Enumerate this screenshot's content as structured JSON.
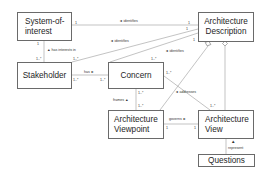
{
  "diagram": {
    "type": "uml-class-diagram",
    "classes": [
      {
        "id": "system_of_interest",
        "label": "System-of-interest"
      },
      {
        "id": "architecture_description",
        "label": "Architecture Description"
      },
      {
        "id": "stakeholder",
        "label": "Stakeholder"
      },
      {
        "id": "concern",
        "label": "Concern"
      },
      {
        "id": "architecture_viewpoint",
        "label": "Architecture Viewpoint"
      },
      {
        "id": "architecture_view",
        "label": "Architecture View"
      },
      {
        "id": "questions",
        "label": "Questions"
      }
    ],
    "labels": {
      "sys_line1": "System-of-",
      "sys_line2": "interest",
      "ad_line1": "Architecture",
      "ad_line2": "Description",
      "stakeholder": "Stakeholder",
      "concern": "Concern",
      "avp_line1": "Architecture",
      "avp_line2": "Viewpoint",
      "av_line1": "Architecture",
      "av_line2": "View",
      "questions": "Questions"
    },
    "associations": [
      {
        "from": "architecture_description",
        "to": "system_of_interest",
        "label": "◄ identifies",
        "mult_from": "1",
        "mult_to": "1"
      },
      {
        "from": "architecture_description",
        "to": "stakeholder",
        "label": "◄ identifies",
        "mult_from": "1",
        "mult_to": "1..*"
      },
      {
        "from": "architecture_description",
        "to": "concern",
        "label": "◄ identifies",
        "mult_from": "1",
        "mult_to": "1..*"
      },
      {
        "from": "stakeholder",
        "to": "system_of_interest",
        "label": "▲ has interests in",
        "mult_from": "1..*",
        "mult_to": "1"
      },
      {
        "from": "stakeholder",
        "to": "concern",
        "label": "has ►",
        "mult_from": "1..*",
        "mult_to": "1..*"
      },
      {
        "from": "architecture_viewpoint",
        "to": "concern",
        "label": "frames ▲",
        "mult_from": "1..*",
        "mult_to": "1..*"
      },
      {
        "from": "architecture_view",
        "to": "concern",
        "label": "◄ addresses",
        "mult_from": "1..*",
        "mult_to": "1..*"
      },
      {
        "from": "architecture_viewpoint",
        "to": "architecture_view",
        "label": "governs ►",
        "mult_from": "1",
        "mult_to": "1"
      },
      {
        "from": "architecture_description",
        "to": "architecture_viewpoint",
        "kind": "composition-aggregation",
        "diamond": "at architecture_description"
      },
      {
        "from": "architecture_description",
        "to": "architecture_view",
        "kind": "aggregation",
        "diamond": "at architecture_description"
      },
      {
        "from": "questions",
        "to": "architecture_view",
        "label": "▲ represent"
      }
    ],
    "assoc_text": {
      "identifies": "◄ identifies",
      "has_interests_in": "▲ has interests in",
      "has": "has ►",
      "frames": "frames ▲",
      "addresses": "◄ addresses",
      "governs": "governs ►",
      "represent": "represent"
    },
    "multiplicities": {
      "one": "1",
      "one_many": "1..*"
    }
  }
}
